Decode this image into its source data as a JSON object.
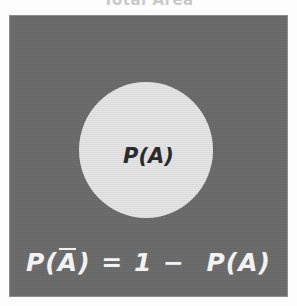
{
  "figure": {
    "title": "Total Area",
    "sample_space": {
      "name": "sample-space-rectangle",
      "fill_color": "#696969",
      "border_color": "#8d8d8d"
    },
    "event_circle": {
      "name": "event-a-circle",
      "fill_color": "#dedede",
      "label": "P(A)",
      "label_color": "#2b2b2b"
    },
    "complement_formula": {
      "full_text": "P(Ā) = 1 − P(A)",
      "lhs_p": "P",
      "lhs_open": "(",
      "lhs_a_bar": "A",
      "lhs_close": ")",
      "equals": "=",
      "one": "1",
      "minus": "−",
      "rhs": "P(A)",
      "color": "#f2f2f2"
    }
  }
}
